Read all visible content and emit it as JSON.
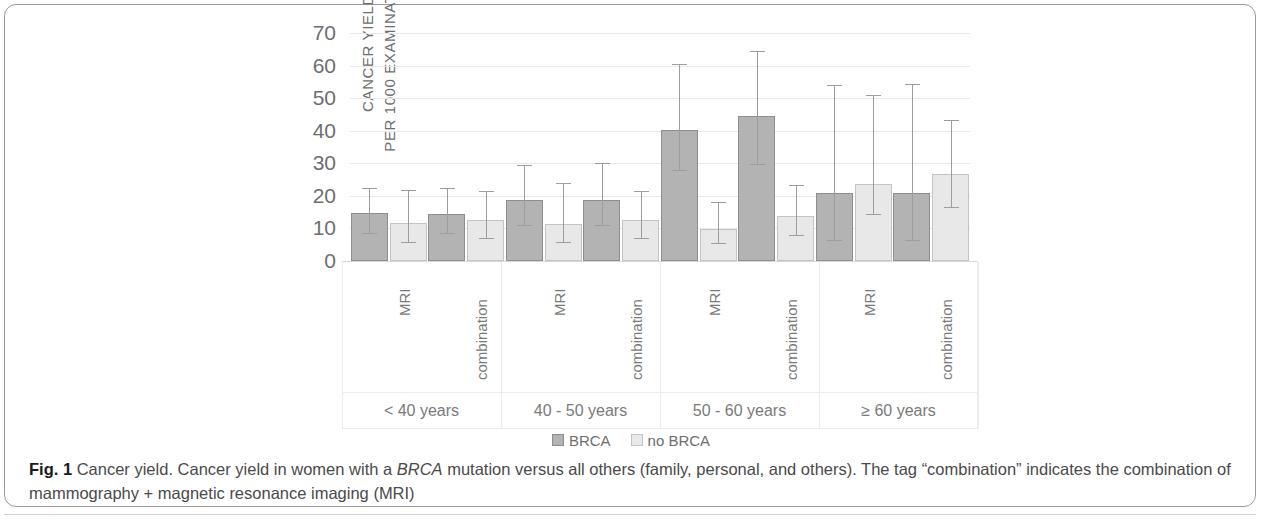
{
  "figure": {
    "label": "Fig. 1",
    "caption_parts": {
      "p1": " Cancer yield. Cancer yield in women with a ",
      "em1": "BRCA",
      "p2": " mutation versus all others (family, personal, and others). The tag “combination” indicates the combination of mammography + magnetic resonance imaging (MRI)"
    }
  },
  "chart_data": {
    "type": "bar",
    "title": "",
    "xlabel": "",
    "ylabel": "CANCER YIELD\nPER 1000 EXAMINATIONS",
    "ylim": [
      0,
      70
    ],
    "yticks": [
      70,
      60,
      50,
      40,
      30,
      20,
      10,
      0
    ],
    "grid": true,
    "legend_position": "bottom",
    "groups": [
      "< 40 years",
      "40 - 50 years",
      "50 - 60 years",
      "≥ 60 years"
    ],
    "modalities": [
      "MRI",
      "combination"
    ],
    "categories": [
      "< 40 years / MRI",
      "< 40 years / combination",
      "40 - 50 years / MRI",
      "40 - 50 years / combination",
      "50 - 60 years / MRI",
      "50 - 60 years / combination",
      "≥ 60 years / MRI",
      "≥ 60 years / combination"
    ],
    "series": [
      {
        "name": "BRCA",
        "color": "#b3b3b3",
        "values": [
          14.6,
          14.5,
          18.6,
          18.7,
          40.2,
          44.5,
          21.0,
          20.8
        ],
        "error_low": [
          8.6,
          8.6,
          11.0,
          11.0,
          27.8,
          29.8,
          6.5,
          6.3
        ],
        "error_high": [
          22.4,
          22.3,
          29.6,
          30.0,
          60.4,
          64.5,
          54.0,
          54.2
        ]
      },
      {
        "name": "no BRCA",
        "color": "#e8e8e8",
        "values": [
          11.6,
          12.6,
          11.4,
          12.5,
          9.8,
          13.8,
          23.6,
          26.8
        ],
        "error_low": [
          5.8,
          7.1,
          5.7,
          7.2,
          5.4,
          8.0,
          14.3,
          16.6
        ],
        "error_high": [
          21.8,
          21.6,
          24.0,
          21.5,
          18.2,
          23.2,
          51.0,
          43.4
        ]
      }
    ]
  },
  "legend": {
    "items": [
      {
        "label": "BRCA",
        "swatch": "brca"
      },
      {
        "label": "no BRCA",
        "swatch": "nobrca"
      }
    ]
  }
}
